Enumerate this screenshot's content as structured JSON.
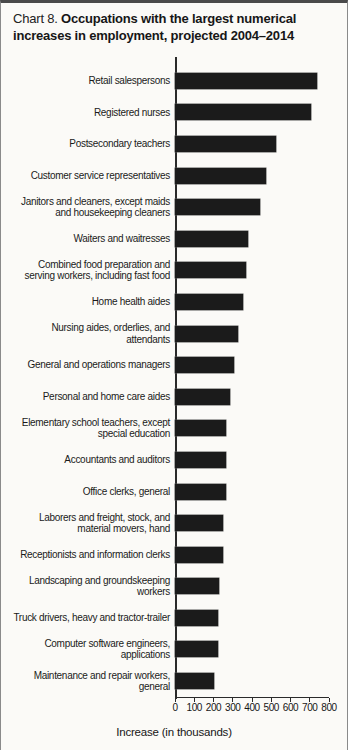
{
  "title": {
    "prefix": "Chart 8.",
    "main": "Occupations with the largest numerical increases in employment, projected 2004–2014"
  },
  "chart_data": {
    "type": "bar",
    "orientation": "horizontal",
    "title": "Chart 8. Occupations with the largest numerical increases in employment, projected 2004–2014",
    "xlabel": "Increase (in thousands)",
    "ylabel": "",
    "xlim": [
      0,
      800
    ],
    "x_ticks": [
      "0",
      "100",
      "200",
      "300",
      "400",
      "500",
      "600",
      "700",
      "800"
    ],
    "grid": false,
    "legend": "none",
    "bar_color": "#1b1b1b",
    "categories": [
      "Retail salespersons",
      "Registered nurses",
      "Postsecondary teachers",
      "Customer service representatives",
      "Janitors and cleaners, except maids\nand housekeeping cleaners",
      "Waiters and waitresses",
      "Combined food preparation and\nserving workers, including fast food",
      "Home health aides",
      "Nursing aides, orderlies, and\nattendants",
      "General and operations managers",
      "Personal and home care aides",
      "Elementary school teachers, except\nspecial education",
      "Accountants and auditors",
      "Office clerks, general",
      "Laborers and freight, stock, and\nmaterial movers, hand",
      "Receptionists and information clerks",
      "Landscaping and groundskeeping\nworkers",
      "Truck drivers, heavy and tractor-trailer",
      "Computer software engineers,\napplications",
      "Maintenance and repair workers,\ngeneral"
    ],
    "values": [
      736,
      703,
      524,
      471,
      440,
      376,
      367,
      350,
      325,
      308,
      287,
      265,
      264,
      263,
      248,
      246,
      230,
      223,
      222,
      202
    ]
  }
}
